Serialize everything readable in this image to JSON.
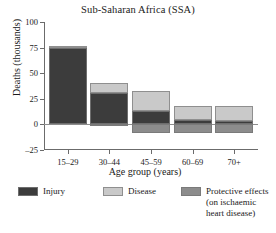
{
  "chart_data": {
    "type": "bar",
    "title": "Sub-Saharan Africa (SSA)",
    "xlabel": "Age group (years)",
    "ylabel": "Deaths (thousands)",
    "categories": [
      "15–29",
      "30–44",
      "45–59",
      "60–69",
      "70+"
    ],
    "ylim": [
      -25,
      100
    ],
    "yticks": [
      -25,
      0,
      25,
      50,
      75,
      100
    ],
    "ytick_labels": [
      "–25",
      "0",
      "25",
      "50",
      "75",
      "100"
    ],
    "grid": false,
    "stacked": true,
    "legend_position": "bottom",
    "series": [
      {
        "name": "Injury",
        "color": "#3c3c3c",
        "values": [
          75,
          31,
          13,
          4,
          3
        ]
      },
      {
        "name": "Disease",
        "color": "#c9c9c9",
        "values": [
          2,
          9,
          20,
          14,
          15
        ]
      },
      {
        "name": "Protective effects (on ischaemic heart disease)",
        "color": "#8c8c8c",
        "values": [
          0,
          -2,
          -8,
          -8,
          -8
        ]
      }
    ],
    "legend": [
      {
        "label": "Injury",
        "color": "#3c3c3c"
      },
      {
        "label": "Disease",
        "color": "#c9c9c9"
      },
      {
        "label_line1": "Protective effects",
        "label_line2": "(on ischaemic",
        "label_line3": "heart disease)",
        "color": "#8c8c8c"
      }
    ]
  }
}
